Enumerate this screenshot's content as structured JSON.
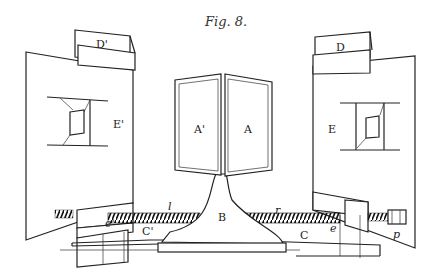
{
  "figure": {
    "title": "Fig. 8.",
    "labels": {
      "D_right": "D",
      "D_left": "D'",
      "E_right": "E",
      "E_left": "E'",
      "A_right": "A",
      "A_left": "A'",
      "B": "B",
      "C_right": "C",
      "C_left": "C'",
      "l": "l",
      "r": "r",
      "e_right": "e",
      "e_left": "e'",
      "p": "p"
    },
    "parts": [
      {
        "id": "A",
        "description": "right mirror panel"
      },
      {
        "id": "A'",
        "description": "left mirror panel"
      },
      {
        "id": "B",
        "description": "central pedestal base"
      },
      {
        "id": "C",
        "description": "right slide rail"
      },
      {
        "id": "C'",
        "description": "left slide rail"
      },
      {
        "id": "D",
        "description": "right upper clamp block"
      },
      {
        "id": "D'",
        "description": "left upper clamp block"
      },
      {
        "id": "E",
        "description": "right framed board with window"
      },
      {
        "id": "E'",
        "description": "left framed board with window"
      },
      {
        "id": "l",
        "description": "left screw rod"
      },
      {
        "id": "r",
        "description": "right screw rod"
      },
      {
        "id": "e",
        "description": "right nut/carriage"
      },
      {
        "id": "e'",
        "description": "left nut/carriage"
      },
      {
        "id": "p",
        "description": "adjusting knob"
      }
    ]
  }
}
